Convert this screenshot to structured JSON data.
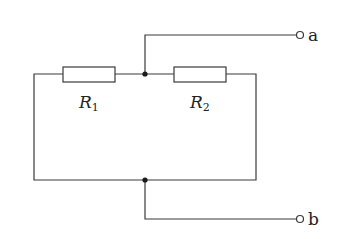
{
  "diagram": {
    "type": "circuit",
    "components": [
      {
        "id": "R1",
        "kind": "resistor",
        "label": "R",
        "subscript": "1"
      },
      {
        "id": "R2",
        "kind": "resistor",
        "label": "R",
        "subscript": "2"
      }
    ],
    "terminals": [
      {
        "id": "a",
        "label": "a"
      },
      {
        "id": "b",
        "label": "b"
      }
    ],
    "junctions": [
      "top-junction",
      "bottom-junction"
    ],
    "connections": [
      "R1 left -> left wire -> bottom junction",
      "R1 right -> top junction",
      "R2 left -> top junction",
      "R2 right -> right wire -> bottom junction",
      "top junction -> terminal a",
      "bottom junction -> terminal b"
    ]
  }
}
